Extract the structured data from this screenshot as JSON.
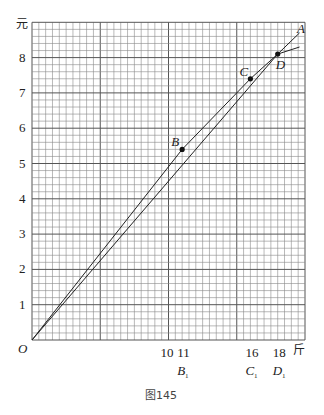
{
  "chart_data": {
    "type": "line",
    "title": "",
    "caption": "图145",
    "xlabel": "斤",
    "ylabel": "元",
    "origin_label": "O",
    "xlim": [
      0,
      20
    ],
    "ylim": [
      0,
      9
    ],
    "grid": true,
    "grid_minor": {
      "x_step": 0.5,
      "y_step": 0.2
    },
    "x_tick_labels": [
      {
        "value": 10,
        "text": "10"
      },
      {
        "value": 11,
        "text": "11"
      },
      {
        "value": 16,
        "text": "16"
      },
      {
        "value": 18,
        "text": "18"
      }
    ],
    "x_sub_labels": [
      {
        "value": 11,
        "text": "B",
        "sub": "1"
      },
      {
        "value": 16,
        "text": "C",
        "sub": "1"
      },
      {
        "value": 18,
        "text": "D",
        "sub": "1"
      }
    ],
    "y_tick_labels": [
      1,
      2,
      3,
      4,
      5,
      6,
      7,
      8
    ],
    "points": [
      {
        "name": "B",
        "x": 11,
        "y": 5.4
      },
      {
        "name": "C",
        "x": 16,
        "y": 7.4
      },
      {
        "name": "D",
        "x": 18,
        "y": 8.1
      }
    ],
    "series": [
      {
        "name": "O-B-C-D-A (broken line)",
        "x": [
          0,
          11,
          16,
          18,
          19.6
        ],
        "y": [
          0,
          5.4,
          7.4,
          8.1,
          8.7
        ]
      },
      {
        "name": "O-D line (straight)",
        "x": [
          0,
          18,
          19.6
        ],
        "y": [
          0,
          8.1,
          8.3
        ]
      }
    ],
    "annotations": [
      "A",
      "B",
      "C",
      "D",
      "O"
    ]
  }
}
